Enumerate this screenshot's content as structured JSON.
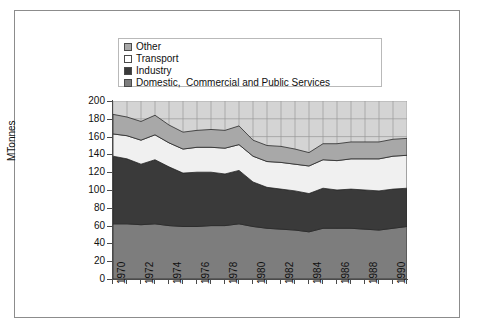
{
  "chart_data": {
    "type": "area",
    "stacked": true,
    "title": "",
    "subtitle": "",
    "xlabel": "",
    "ylabel": "MTonnes",
    "ylim": [
      0,
      200
    ],
    "ytick_step": 20,
    "yticks": [
      "0",
      "20",
      "40",
      "60",
      "80",
      "100",
      "120",
      "140",
      "160",
      "180",
      "200"
    ],
    "xlim": [
      1970,
      1991
    ],
    "x": [
      1970,
      1971,
      1972,
      1973,
      1974,
      1975,
      1976,
      1977,
      1978,
      1979,
      1980,
      1981,
      1982,
      1983,
      1984,
      1985,
      1986,
      1987,
      1988,
      1989,
      1990,
      1991
    ],
    "xtick_labels": [
      "1970",
      "1972",
      "1974",
      "1976",
      "1978",
      "1980",
      "1982",
      "1984",
      "1986",
      "1988",
      "1990"
    ],
    "xtick_label_rotation": -90,
    "grid": true,
    "grid_color": "#9a9a9a",
    "plot_background": "#d4d4d4",
    "legend_position": "top",
    "stack_order_bottom_to_top": [
      "Domestic,  Commercial and Public Services",
      "Industry",
      "Transport",
      "Other"
    ],
    "series": [
      {
        "name": "Domestic,  Commercial and Public Services",
        "color": "#7d7d7d",
        "values": [
          62,
          62,
          61,
          62,
          60,
          59,
          59,
          60,
          60,
          62,
          59,
          57,
          56,
          55,
          53,
          57,
          57,
          57,
          56,
          55,
          57,
          59
        ]
      },
      {
        "name": "Industry",
        "color": "#3a3a3a",
        "values": [
          76,
          73,
          68,
          72,
          66,
          60,
          61,
          60,
          58,
          60,
          50,
          46,
          45,
          44,
          43,
          45,
          43,
          44,
          44,
          44,
          44,
          43
        ]
      },
      {
        "name": "Transport",
        "color": "#f0f0f0",
        "values": [
          25,
          26,
          27,
          28,
          27,
          27,
          28,
          28,
          29,
          29,
          29,
          29,
          30,
          30,
          31,
          32,
          33,
          34,
          35,
          36,
          37,
          37
        ]
      },
      {
        "name": "Other",
        "color": "#a8a8a8",
        "values": [
          22,
          21,
          21,
          22,
          20,
          19,
          19,
          20,
          20,
          21,
          18,
          18,
          18,
          17,
          15,
          18,
          19,
          19,
          19,
          19,
          19,
          19
        ]
      }
    ],
    "totals": [
      185,
      182,
      177,
      184,
      173,
      165,
      167,
      168,
      167,
      172,
      156,
      150,
      149,
      146,
      142,
      152,
      152,
      154,
      154,
      154,
      157,
      158
    ]
  },
  "legend": {
    "entries": [
      {
        "label": "Other",
        "swatch_color": "#a8a8a8"
      },
      {
        "label": "Transport",
        "swatch_color": "#ffffff"
      },
      {
        "label": "Industry",
        "swatch_color": "#3a3a3a"
      },
      {
        "label": "Domestic,  Commercial and Public Services",
        "swatch_color": "#7d7d7d"
      }
    ]
  }
}
